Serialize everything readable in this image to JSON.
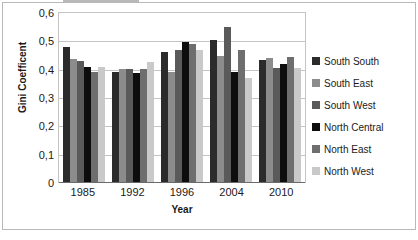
{
  "chart_data": {
    "type": "bar",
    "title": "",
    "xlabel": "Year",
    "ylabel": "Gini Coefficent",
    "categories": [
      "1985",
      "1992",
      "1996",
      "2004",
      "2010"
    ],
    "ylim": [
      0,
      0.6
    ],
    "ytick_labels": [
      "0,6",
      "0,5",
      "0,4",
      "0,3",
      "0,2",
      "0,1",
      "0"
    ],
    "ytick_values": [
      0.6,
      0.5,
      0.4,
      0.3,
      0.2,
      0.1,
      0
    ],
    "grid": true,
    "legend_position": "right",
    "series": [
      {
        "name": "South South",
        "color": "#2b2b2b",
        "values": [
          0.48,
          0.39,
          0.46,
          0.505,
          0.433
        ]
      },
      {
        "name": "South East",
        "color": "#8c8c8c",
        "values": [
          0.437,
          0.4,
          0.39,
          0.447,
          0.441
        ]
      },
      {
        "name": "South West",
        "color": "#5a5a5a",
        "values": [
          0.428,
          0.4,
          0.47,
          0.55,
          0.405
        ]
      },
      {
        "name": "North Central",
        "color": "#0d0d0d",
        "values": [
          0.41,
          0.388,
          0.498,
          0.39,
          0.418
        ]
      },
      {
        "name": "North East",
        "color": "#6e6e6e",
        "values": [
          0.39,
          0.4,
          0.49,
          0.468,
          0.443
        ]
      },
      {
        "name": "North West",
        "color": "#c9c9c9",
        "values": [
          0.408,
          0.427,
          0.47,
          0.37,
          0.405
        ]
      }
    ]
  }
}
